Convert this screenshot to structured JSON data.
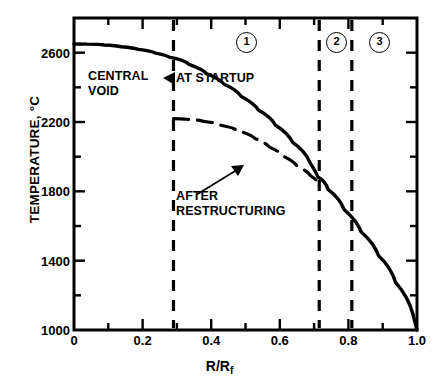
{
  "chart_data": {
    "type": "line",
    "title": "",
    "xlabel": "R/Rf",
    "xlabel_main": "R/R",
    "xlabel_sub": "f",
    "ylabel": "TEMPERATURE, °C",
    "xlim": [
      0,
      1.0
    ],
    "ylim": [
      1000,
      2800
    ],
    "grid": false,
    "legend": "none",
    "xticks": [
      0,
      0.1,
      0.2,
      0.3,
      0.4,
      0.5,
      0.6,
      0.7,
      0.8,
      0.9,
      1.0
    ],
    "xtick_labels": [
      "0",
      "",
      "0.2",
      "",
      "0.4",
      "",
      "0.6",
      "",
      "0.8",
      "",
      "1.0"
    ],
    "yticks": [
      1000,
      1200,
      1400,
      1600,
      1800,
      2000,
      2200,
      2400,
      2600,
      2800
    ],
    "ytick_labels": [
      "1000",
      "",
      "1400",
      "",
      "1800",
      "",
      "2200",
      "",
      "2600",
      ""
    ],
    "series": [
      {
        "name": "AT STARTUP",
        "style": "solid",
        "points": [
          [
            0.0,
            2650
          ],
          [
            0.05,
            2648
          ],
          [
            0.1,
            2640
          ],
          [
            0.15,
            2628
          ],
          [
            0.2,
            2610
          ],
          [
            0.25,
            2585
          ],
          [
            0.29,
            2560
          ],
          [
            0.35,
            2505
          ],
          [
            0.4,
            2450
          ],
          [
            0.45,
            2385
          ],
          [
            0.5,
            2310
          ],
          [
            0.55,
            2228
          ],
          [
            0.6,
            2135
          ],
          [
            0.65,
            2030
          ],
          [
            0.7,
            1905
          ],
          [
            0.715,
            1860
          ],
          [
            0.75,
            1760
          ],
          [
            0.8,
            1630
          ],
          [
            0.85,
            1500
          ],
          [
            0.9,
            1360
          ],
          [
            0.95,
            1190
          ],
          [
            1.0,
            1000
          ]
        ]
      },
      {
        "name": "AFTER RESTRUCTURING",
        "style": "dashed",
        "points": [
          [
            0.29,
            2220
          ],
          [
            0.34,
            2212
          ],
          [
            0.39,
            2195
          ],
          [
            0.44,
            2168
          ],
          [
            0.49,
            2130
          ],
          [
            0.54,
            2080
          ],
          [
            0.58,
            2030
          ],
          [
            0.62,
            1975
          ],
          [
            0.66,
            1918
          ],
          [
            0.7,
            1862
          ],
          [
            0.72,
            1830
          ]
        ]
      }
    ],
    "vertical_lines": [
      {
        "x": 0.29,
        "style": "dashed"
      },
      {
        "x": 0.715,
        "style": "dashed"
      },
      {
        "x": 0.81,
        "style": "dashed"
      }
    ],
    "annotations": [
      {
        "id": "central-void",
        "text": "CENTRAL\nVOID",
        "x": 0.085,
        "y": 2450
      },
      {
        "id": "at-startup",
        "text": "AT STARTUP",
        "x": 0.4,
        "y": 2455,
        "arrow": "left"
      },
      {
        "id": "after-restructuring",
        "text": "AFTER\nRESTRUCTURING",
        "x": 0.355,
        "y": 1855,
        "arrow": "up-right"
      }
    ],
    "region_labels": [
      {
        "label": "1",
        "x": 0.5,
        "y": 2735
      },
      {
        "label": "2",
        "x": 0.763,
        "y": 2735
      },
      {
        "label": "3",
        "x": 0.888,
        "y": 2735
      }
    ],
    "colors": {
      "line": "#000000",
      "axis": "#000000",
      "background": "#ffffff"
    }
  },
  "axis": {
    "y_title": "TEMPERATURE, °C",
    "x_title_main": "R/R",
    "x_title_sub": "f"
  },
  "labels": {
    "central_void_line1": "CENTRAL",
    "central_void_line2": "VOID",
    "at_startup": "AT STARTUP",
    "after_line1": "AFTER",
    "after_line2": "RESTRUCTURING",
    "region1": "1",
    "region2": "2",
    "region3": "3"
  },
  "ytick_labels": {
    "t1000": "1000",
    "t1400": "1400",
    "t1800": "1800",
    "t2200": "2200",
    "t2600": "2600"
  },
  "xtick_labels": {
    "t0": "0",
    "t02": "0.2",
    "t04": "0.4",
    "t06": "0.6",
    "t08": "0.8",
    "t10": "1.0"
  }
}
